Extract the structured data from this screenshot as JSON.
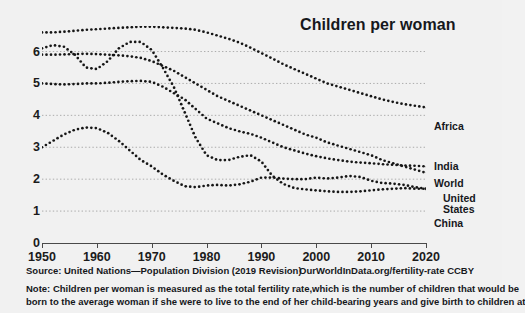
{
  "chart_data": {
    "type": "line",
    "title": "Children per woman",
    "xlabel": "",
    "ylabel": "",
    "xlim": [
      1950,
      2020
    ],
    "ylim": [
      0,
      6.8
    ],
    "grid": true,
    "legend_position": "right-inline",
    "marker_style": "dotted",
    "xticks": [
      1950,
      1960,
      1970,
      1980,
      1990,
      2000,
      2010,
      2020
    ],
    "yticks": [
      0,
      1,
      2,
      3,
      4,
      5,
      6
    ],
    "series": [
      {
        "name": "Africa",
        "color": "#161616",
        "x": [
          1950,
          1952,
          1954,
          1956,
          1958,
          1960,
          1962,
          1964,
          1966,
          1968,
          1970,
          1972,
          1974,
          1976,
          1978,
          1980,
          1982,
          1984,
          1986,
          1988,
          1990,
          1992,
          1994,
          1996,
          1998,
          2000,
          2002,
          2004,
          2006,
          2008,
          2010,
          2012,
          2014,
          2016,
          2018,
          2020
        ],
        "values": [
          6.6,
          6.6,
          6.62,
          6.65,
          6.68,
          6.7,
          6.72,
          6.74,
          6.76,
          6.78,
          6.78,
          6.76,
          6.74,
          6.72,
          6.68,
          6.6,
          6.5,
          6.4,
          6.28,
          6.12,
          5.95,
          5.78,
          5.6,
          5.45,
          5.3,
          5.15,
          5.0,
          4.9,
          4.8,
          4.7,
          4.6,
          4.5,
          4.42,
          4.35,
          4.3,
          4.25
        ]
      },
      {
        "name": "India",
        "color": "#161616",
        "x": [
          1950,
          1952,
          1954,
          1956,
          1958,
          1960,
          1962,
          1964,
          1966,
          1968,
          1970,
          1972,
          1974,
          1976,
          1978,
          1980,
          1982,
          1984,
          1986,
          1988,
          1990,
          1992,
          1994,
          1996,
          1998,
          2000,
          2002,
          2004,
          2006,
          2008,
          2010,
          2012,
          2014,
          2016,
          2018,
          2020
        ],
        "values": [
          5.9,
          5.9,
          5.91,
          5.92,
          5.93,
          5.92,
          5.9,
          5.88,
          5.85,
          5.8,
          5.7,
          5.55,
          5.4,
          5.2,
          5.0,
          4.8,
          4.6,
          4.45,
          4.3,
          4.15,
          4.0,
          3.85,
          3.7,
          3.55,
          3.4,
          3.3,
          3.15,
          3.05,
          2.95,
          2.85,
          2.75,
          2.6,
          2.5,
          2.4,
          2.3,
          2.2
        ]
      },
      {
        "name": "World",
        "color": "#161616",
        "x": [
          1950,
          1952,
          1954,
          1956,
          1958,
          1960,
          1962,
          1964,
          1966,
          1968,
          1970,
          1972,
          1974,
          1976,
          1978,
          1980,
          1982,
          1984,
          1986,
          1988,
          1990,
          1992,
          1994,
          1996,
          1998,
          2000,
          2002,
          2004,
          2006,
          2008,
          2010,
          2012,
          2014,
          2016,
          2018,
          2020
        ],
        "values": [
          5.0,
          4.98,
          4.97,
          4.98,
          5.0,
          5.0,
          5.02,
          5.05,
          5.07,
          5.08,
          5.05,
          4.9,
          4.7,
          4.5,
          4.2,
          3.9,
          3.75,
          3.6,
          3.5,
          3.42,
          3.3,
          3.15,
          3.0,
          2.9,
          2.8,
          2.72,
          2.65,
          2.6,
          2.55,
          2.52,
          2.5,
          2.47,
          2.45,
          2.43,
          2.42,
          2.4
        ]
      },
      {
        "name": "United States",
        "color": "#161616",
        "x": [
          1950,
          1952,
          1954,
          1956,
          1958,
          1960,
          1962,
          1964,
          1966,
          1968,
          1970,
          1972,
          1974,
          1976,
          1978,
          1980,
          1982,
          1984,
          1986,
          1988,
          1990,
          1992,
          1994,
          1996,
          1998,
          2000,
          2002,
          2004,
          2006,
          2008,
          2010,
          2012,
          2014,
          2016,
          2018,
          2020
        ],
        "values": [
          3.0,
          3.2,
          3.4,
          3.55,
          3.62,
          3.6,
          3.45,
          3.2,
          2.9,
          2.6,
          2.4,
          2.15,
          1.95,
          1.78,
          1.75,
          1.8,
          1.82,
          1.8,
          1.84,
          1.92,
          2.05,
          2.05,
          2.02,
          2.0,
          2.0,
          2.05,
          2.02,
          2.05,
          2.1,
          2.07,
          1.95,
          1.88,
          1.86,
          1.82,
          1.75,
          1.7
        ]
      },
      {
        "name": "China",
        "color": "#161616",
        "x": [
          1950,
          1952,
          1954,
          1956,
          1958,
          1960,
          1962,
          1964,
          1966,
          1968,
          1970,
          1972,
          1974,
          1976,
          1978,
          1980,
          1982,
          1984,
          1986,
          1988,
          1990,
          1992,
          1994,
          1996,
          1998,
          2000,
          2002,
          2004,
          2006,
          2008,
          2010,
          2012,
          2014,
          2016,
          2018,
          2020
        ],
        "values": [
          6.1,
          6.2,
          6.15,
          5.9,
          5.5,
          5.45,
          5.7,
          6.1,
          6.3,
          6.3,
          6.05,
          5.5,
          4.9,
          4.1,
          3.3,
          2.75,
          2.6,
          2.6,
          2.7,
          2.75,
          2.55,
          2.1,
          1.85,
          1.72,
          1.68,
          1.65,
          1.62,
          1.6,
          1.6,
          1.62,
          1.65,
          1.68,
          1.7,
          1.72,
          1.7,
          1.7
        ]
      }
    ],
    "annotations": {
      "series_labels": [
        "Africa",
        "India",
        "World",
        "United States",
        "China"
      ]
    }
  },
  "footer": {
    "source_left": "Source: United Nations—Population Division (2019 Revision)",
    "source_right": "OurWorldInData.org/fertility-rate CCBY",
    "note_line1": "Note: Children per woman is measured as the total fertility rate,which is the number of children that would be",
    "note_line2": "born to the average woman if she were to live to the end of her child-bearing years and give birth to children at"
  },
  "series_label_text": {
    "africa": "Africa",
    "india": "India",
    "world": "World",
    "united_states_line1": "United",
    "united_states_line2": "States",
    "china": "China"
  }
}
